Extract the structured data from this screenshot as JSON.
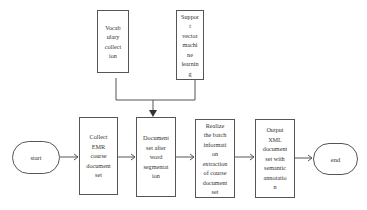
{
  "diagram": {
    "type": "flowchart",
    "nodes": {
      "start": {
        "label": "start",
        "shape": "terminator"
      },
      "vocab": {
        "label": "Vocab\nulary\ncollect\nion",
        "shape": "process"
      },
      "svm": {
        "label": "Suppor\nt\nvector\nmachi\nne\nlearnin\ng",
        "shape": "process"
      },
      "collect": {
        "label": "Collect\nEMR\ncourse\ndocument\nset",
        "shape": "process"
      },
      "segmented": {
        "label": "Document\nset after\nword\nsegmentat\nion",
        "shape": "process"
      },
      "extract": {
        "label": "Realize\nthe batch\ninformati\non\nextraction\nof course\ndocument\nset",
        "shape": "process"
      },
      "output": {
        "label": "Output\nXML\ndocument\nset with\nsemantic\nannotatio\nn",
        "shape": "process"
      },
      "end": {
        "label": "end",
        "shape": "terminator"
      }
    },
    "edges": [
      {
        "from": "start",
        "to": "collect",
        "style": "open-arrow"
      },
      {
        "from": "collect",
        "to": "segmented",
        "style": "open-arrow"
      },
      {
        "from": "vocab",
        "to": "segmented",
        "style": "filled-arrow",
        "via": "merge"
      },
      {
        "from": "svm",
        "to": "segmented",
        "style": "filled-arrow",
        "via": "merge"
      },
      {
        "from": "segmented",
        "to": "extract",
        "style": "open-arrow"
      },
      {
        "from": "extract",
        "to": "output",
        "style": "open-arrow"
      },
      {
        "from": "output",
        "to": "end",
        "style": "open-arrow"
      }
    ],
    "colors": {
      "stroke": "#555555",
      "text": "#333333",
      "background": "#ffffff"
    }
  }
}
